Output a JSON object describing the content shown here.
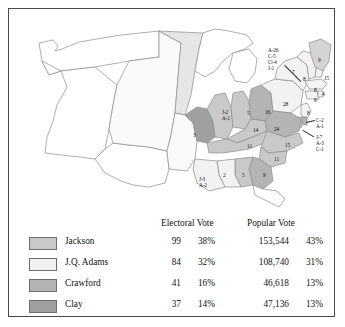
{
  "map": {
    "title": "Election of 1824 electoral map",
    "colors": {
      "jackson": "#c9c9c9",
      "adams": "#f2f2f2",
      "crawford": "#b4b4b4",
      "clay": "#a0a0a0",
      "territory": "#ffffff",
      "outline": "#8c8c8c",
      "border": "#4a4a4a"
    },
    "state_labels": [
      {
        "name": "missouri",
        "text": "3",
        "x": 184,
        "y": 123,
        "multi": false
      },
      {
        "name": "illinois",
        "text": "J-2\nA-1",
        "x": 213,
        "y": 100,
        "multi": true
      },
      {
        "name": "indiana",
        "text": "5",
        "x": 238,
        "y": 101,
        "multi": false
      },
      {
        "name": "ohio",
        "text": "16",
        "x": 256,
        "y": 100,
        "multi": false
      },
      {
        "name": "kentucky",
        "text": "14",
        "x": 244,
        "y": 118,
        "multi": false
      },
      {
        "name": "tennessee",
        "text": "11",
        "x": 238,
        "y": 134,
        "multi": false
      },
      {
        "name": "virginia",
        "text": "24",
        "x": 265,
        "y": 117,
        "multi": false
      },
      {
        "name": "pennsylvania",
        "text": "28",
        "x": 274,
        "y": 92,
        "multi": false
      },
      {
        "name": "north-carolina",
        "text": "15",
        "x": 276,
        "y": 133,
        "multi": false
      },
      {
        "name": "south-carolina",
        "text": "11",
        "x": 265,
        "y": 147,
        "multi": false
      },
      {
        "name": "georgia",
        "text": "9",
        "x": 254,
        "y": 163,
        "multi": false
      },
      {
        "name": "alabama",
        "text": "5",
        "x": 233,
        "y": 163,
        "multi": false
      },
      {
        "name": "mississippi",
        "text": "2",
        "x": 214,
        "y": 163,
        "multi": false
      },
      {
        "name": "louisiana",
        "text": "J-3\nA-2",
        "x": 190,
        "y": 167,
        "multi": true
      },
      {
        "name": "new-york",
        "text": "7",
        "x": 283,
        "y": 60,
        "multi": false
      },
      {
        "name": "vermont",
        "text": "8",
        "x": 294,
        "y": 67,
        "multi": false
      },
      {
        "name": "maine",
        "text": "9",
        "x": 309,
        "y": 48,
        "multi": false
      },
      {
        "name": "new-hampshire",
        "text": "15",
        "x": 315,
        "y": 66,
        "multi": false
      },
      {
        "name": "massachusetts-small",
        "text": "8",
        "x": 305,
        "y": 78,
        "multi": false
      },
      {
        "name": "rhode-island",
        "text": "4",
        "x": 313,
        "y": 82,
        "multi": false
      },
      {
        "name": "connecticut",
        "text": "8",
        "x": 305,
        "y": 88,
        "multi": false
      },
      {
        "name": "new-jersey",
        "text": "8",
        "x": 298,
        "y": 101,
        "multi": false
      }
    ],
    "leader_labels": [
      {
        "name": "new-england-breakdown",
        "text": "A-26\nC-5\nCl-4\nJ-1",
        "x": 259,
        "y": 38,
        "line": {
          "x1": 276,
          "y1": 56,
          "x2": 292,
          "y2": 72
        }
      },
      {
        "name": "delaware-breakdown",
        "text": "C-2\nA-1",
        "x": 307,
        "y": 108,
        "line": {
          "x1": 297,
          "y1": 113,
          "x2": 305,
          "y2": 111
        }
      },
      {
        "name": "maryland-breakdown",
        "text": "J-7\nA-3\nC-1",
        "x": 307,
        "y": 125,
        "line": {
          "x1": 294,
          "y1": 121,
          "x2": 305,
          "y2": 128
        }
      }
    ]
  },
  "table": {
    "headers": {
      "electoral": "Electoral Vote",
      "popular": "Popular Vote"
    },
    "rows": [
      {
        "candidate": "Jackson",
        "swatch": "#c9c9c9",
        "electoral_votes": "99",
        "electoral_pct": "38%",
        "popular_votes": "153,544",
        "popular_pct": "43%"
      },
      {
        "candidate": "J.Q. Adams",
        "swatch": "#f2f2f2",
        "electoral_votes": "84",
        "electoral_pct": "32%",
        "popular_votes": "108,740",
        "popular_pct": "31%"
      },
      {
        "candidate": "Crawford",
        "swatch": "#b4b4b4",
        "electoral_votes": "41",
        "electoral_pct": "16%",
        "popular_votes": "46,618",
        "popular_pct": "13%"
      },
      {
        "candidate": "Clay",
        "swatch": "#a0a0a0",
        "electoral_votes": "37",
        "electoral_pct": "14%",
        "popular_votes": "47,136",
        "popular_pct": "13%"
      }
    ]
  }
}
